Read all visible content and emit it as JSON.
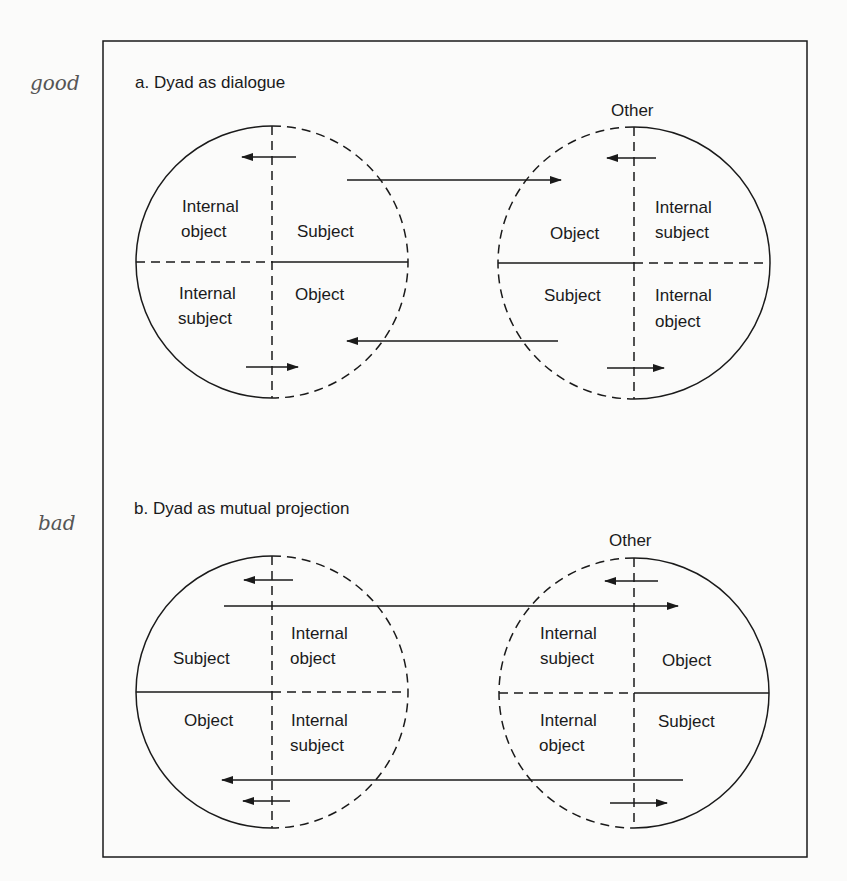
{
  "margin_notes": [
    "good",
    "bad"
  ],
  "panels": [
    {
      "id": "a",
      "title": "a. Dyad as dialogue",
      "margin_note": "good",
      "left_circle": {
        "quadrants": {
          "top_left": [
            "Internal",
            "object"
          ],
          "top_right": [
            "Subject"
          ],
          "bottom_left": [
            "Internal",
            "subject"
          ],
          "bottom_right": [
            "Object"
          ]
        }
      },
      "right_circle": {
        "label": "Other",
        "quadrants": {
          "top_left": [
            "Object"
          ],
          "top_right": [
            "Internal",
            "subject"
          ],
          "bottom_left": [
            "Subject"
          ],
          "bottom_right": [
            "Internal",
            "object"
          ]
        }
      }
    },
    {
      "id": "b",
      "title": "b. Dyad as mutual projection",
      "margin_note": "bad",
      "left_circle": {
        "quadrants": {
          "top_left": [
            "Subject"
          ],
          "top_right": [
            "Internal",
            "object"
          ],
          "bottom_left": [
            "Object"
          ],
          "bottom_right": [
            "Internal",
            "subject"
          ]
        }
      },
      "right_circle": {
        "label": "Other",
        "quadrants": {
          "top_left": [
            "Internal",
            "subject"
          ],
          "top_right": [
            "Object"
          ],
          "bottom_left": [
            "Internal",
            "object"
          ],
          "bottom_right": [
            "Subject"
          ]
        }
      }
    }
  ]
}
